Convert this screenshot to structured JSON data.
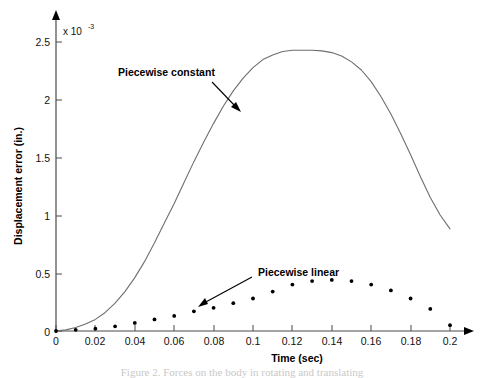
{
  "figure": {
    "caption_partial": "Figure 2. Forces on the body in rotating and translating"
  },
  "chart_data": {
    "type": "scatter",
    "title": "",
    "xlabel": "Time (sec)",
    "ylabel": "Displacement error (in.)",
    "y_exponent_label": "x 10",
    "y_exponent_power": "-3",
    "xlim": [
      0,
      0.2
    ],
    "ylim": [
      0,
      2.6
    ],
    "grid": false,
    "legend_position": "inline-annotations",
    "x_ticks": [
      0,
      0.02,
      0.04,
      0.06,
      0.08,
      0.1,
      0.12,
      0.14,
      0.16,
      0.18,
      0.2
    ],
    "x_tick_labels": [
      "0",
      "0.02",
      "0.04",
      "0.06",
      "0.08",
      "0.1",
      "0.12",
      "0.14",
      "0.16",
      "0.18",
      "0.2"
    ],
    "y_ticks": [
      0,
      0.5,
      1,
      1.5,
      2,
      2.5
    ],
    "y_tick_labels": [
      "0",
      "0.5",
      "1",
      "1.5",
      "2",
      "2.5"
    ],
    "series": [
      {
        "name": "Piecewise constant",
        "style": "line",
        "color": "#6e6e6e",
        "x": [
          0,
          0.005,
          0.01,
          0.015,
          0.02,
          0.025,
          0.03,
          0.035,
          0.04,
          0.045,
          0.05,
          0.055,
          0.06,
          0.065,
          0.07,
          0.075,
          0.08,
          0.085,
          0.09,
          0.095,
          0.1,
          0.105,
          0.11,
          0.115,
          0.12,
          0.125,
          0.13,
          0.135,
          0.14,
          0.145,
          0.15,
          0.155,
          0.16,
          0.165,
          0.17,
          0.175,
          0.18,
          0.185,
          0.19,
          0.195,
          0.2
        ],
        "values": [
          0.0,
          0.01,
          0.03,
          0.06,
          0.1,
          0.16,
          0.24,
          0.34,
          0.46,
          0.6,
          0.76,
          0.93,
          1.1,
          1.28,
          1.46,
          1.63,
          1.79,
          1.94,
          2.07,
          2.18,
          2.27,
          2.34,
          2.38,
          2.41,
          2.42,
          2.42,
          2.42,
          2.415,
          2.4,
          2.37,
          2.32,
          2.25,
          2.15,
          2.02,
          1.87,
          1.7,
          1.52,
          1.33,
          1.15,
          1.0,
          0.88
        ]
      },
      {
        "name": "Piecewise linear",
        "style": "dots",
        "color": "#000000",
        "x": [
          0,
          0.01,
          0.02,
          0.03,
          0.04,
          0.05,
          0.06,
          0.07,
          0.08,
          0.09,
          0.1,
          0.11,
          0.12,
          0.13,
          0.14,
          0.15,
          0.16,
          0.17,
          0.18,
          0.19,
          0.2
        ],
        "values": [
          0.0,
          0.01,
          0.02,
          0.04,
          0.07,
          0.1,
          0.13,
          0.17,
          0.2,
          0.24,
          0.28,
          0.34,
          0.4,
          0.43,
          0.44,
          0.43,
          0.4,
          0.35,
          0.28,
          0.19,
          0.05
        ]
      }
    ],
    "annotations": [
      {
        "text": "Piecewise constant",
        "text_x": 118,
        "text_y": 76,
        "arrow_from_x": 212,
        "arrow_from_y": 82,
        "arrow_to_x": 240,
        "arrow_to_y": 111
      },
      {
        "text": "Piecewise linear",
        "text_x": 258,
        "text_y": 276,
        "arrow_from_x": 252,
        "arrow_from_y": 277,
        "arrow_to_x": 200,
        "arrow_to_y": 306
      }
    ]
  }
}
